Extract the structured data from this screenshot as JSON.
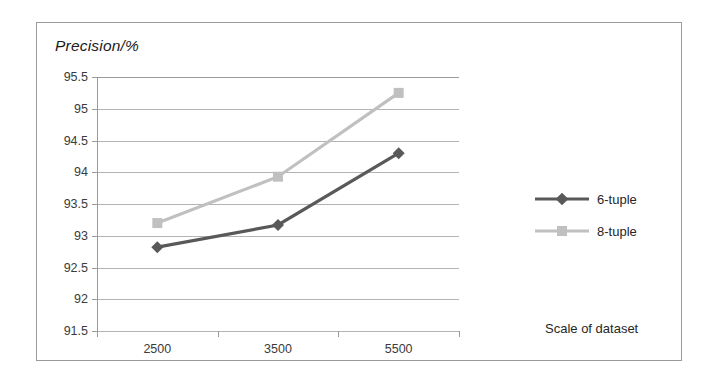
{
  "chart_data": {
    "type": "line",
    "title": "",
    "ylabel": "Precision/%",
    "xlabel": "Scale of dataset",
    "categories": [
      "2500",
      "3500",
      "5500"
    ],
    "series": [
      {
        "name": "6-tuple",
        "values": [
          92.82,
          93.17,
          94.3
        ],
        "color": "#595959",
        "marker": "diamond"
      },
      {
        "name": "8-tuple",
        "values": [
          93.2,
          93.93,
          95.25
        ],
        "color": "#c0c0c0",
        "marker": "square"
      }
    ],
    "ylim": [
      91.5,
      95.5
    ],
    "ytick_labels": [
      "95.5",
      "95",
      "94.5",
      "94",
      "93.5",
      "93",
      "92.5",
      "92",
      "91.5"
    ],
    "ytick_values": [
      95.5,
      95,
      94.5,
      94,
      93.5,
      93,
      92.5,
      92,
      91.5
    ],
    "grid": true,
    "legend_position": "right"
  },
  "legend": {
    "entries": [
      {
        "label": "6-tuple"
      },
      {
        "label": "8-tuple"
      }
    ]
  },
  "colors": {
    "series_6tuple": "#595959",
    "series_8tuple": "#c0c0c0",
    "gridline": "#b4b4b4",
    "axis": "#9a9a9a",
    "text": "#262626",
    "border": "#9a9a9a"
  }
}
